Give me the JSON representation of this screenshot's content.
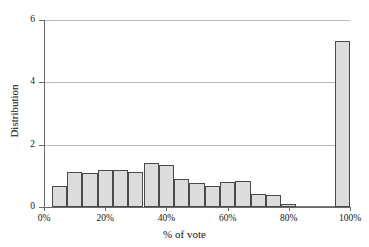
{
  "chart_data": {
    "type": "bar",
    "title": "",
    "subtitle": "",
    "xlabel": "% of vote",
    "ylabel": "Distribution",
    "xlim": [
      0,
      100
    ],
    "ylim": [
      0,
      6
    ],
    "grid": true,
    "legend": null,
    "xticks": [
      "0%",
      "20%",
      "40%",
      "60%",
      "80%",
      "100%"
    ],
    "xtick_values": [
      0,
      20,
      40,
      60,
      80,
      100
    ],
    "yticks": [
      "0",
      "2",
      "4",
      "6"
    ],
    "ytick_values": [
      0,
      2,
      4,
      6
    ],
    "bin_width": 5,
    "bar_color": "#dcdcdc",
    "bar_edge_color": "#4a4a4a",
    "categories": [
      "2.5-7.5%",
      "7.5-12.5%",
      "12.5-17.5%",
      "17.5-22.5%",
      "22.5-27.5%",
      "27.5-32.5%",
      "32.5-37.5%",
      "37.5-42.5%",
      "42.5-47.5%",
      "47.5-52.5%",
      "52.5-57.5%",
      "57.5-62.5%",
      "62.5-67.5%",
      "67.5-72.5%",
      "72.5-77.5%",
      "77.5-82.5%",
      "82.5-87.5%",
      "87.5-92.5%",
      "92.5-97.5%",
      "95-100%"
    ],
    "bin_starts": [
      2.5,
      7.5,
      12.5,
      17.5,
      22.5,
      27.5,
      32.5,
      37.5,
      42.5,
      47.5,
      52.5,
      57.5,
      62.5,
      67.5,
      72.5,
      77.5,
      82.5,
      87.5,
      92.5,
      95
    ],
    "values": [
      0.68,
      1.14,
      1.08,
      1.2,
      1.2,
      1.14,
      1.42,
      1.34,
      0.9,
      0.76,
      0.68,
      0.8,
      0.84,
      0.42,
      0.38,
      0.1,
      0.03,
      0.02,
      0.02,
      5.33
    ]
  }
}
